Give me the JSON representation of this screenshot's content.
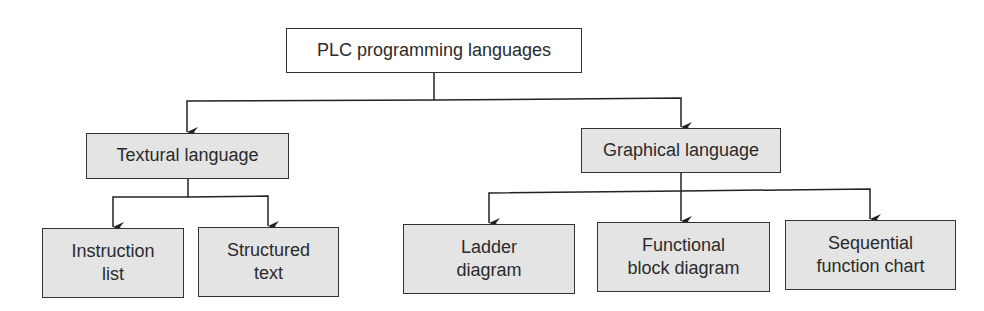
{
  "diagram": {
    "root": {
      "id": "plc",
      "label": "PLC programming languages"
    },
    "categories": [
      {
        "id": "textural",
        "label": "Textural language",
        "children": [
          {
            "id": "il",
            "label": "Instruction\nlist"
          },
          {
            "id": "st",
            "label": "Structured\ntext"
          }
        ]
      },
      {
        "id": "graphical",
        "label": "Graphical language",
        "children": [
          {
            "id": "ld",
            "label": "Ladder\ndiagram"
          },
          {
            "id": "fbd",
            "label": "Functional\nblock diagram"
          },
          {
            "id": "sfc",
            "label": "Sequential\nfunction chart"
          }
        ]
      }
    ],
    "edges": [
      [
        "plc",
        "textural"
      ],
      [
        "plc",
        "graphical"
      ],
      [
        "textural",
        "il"
      ],
      [
        "textural",
        "st"
      ],
      [
        "graphical",
        "ld"
      ],
      [
        "graphical",
        "fbd"
      ],
      [
        "graphical",
        "sfc"
      ]
    ],
    "colors": {
      "shaded_fill": "#e4e4e4",
      "root_fill": "#ffffff",
      "stroke": "#333333"
    }
  }
}
